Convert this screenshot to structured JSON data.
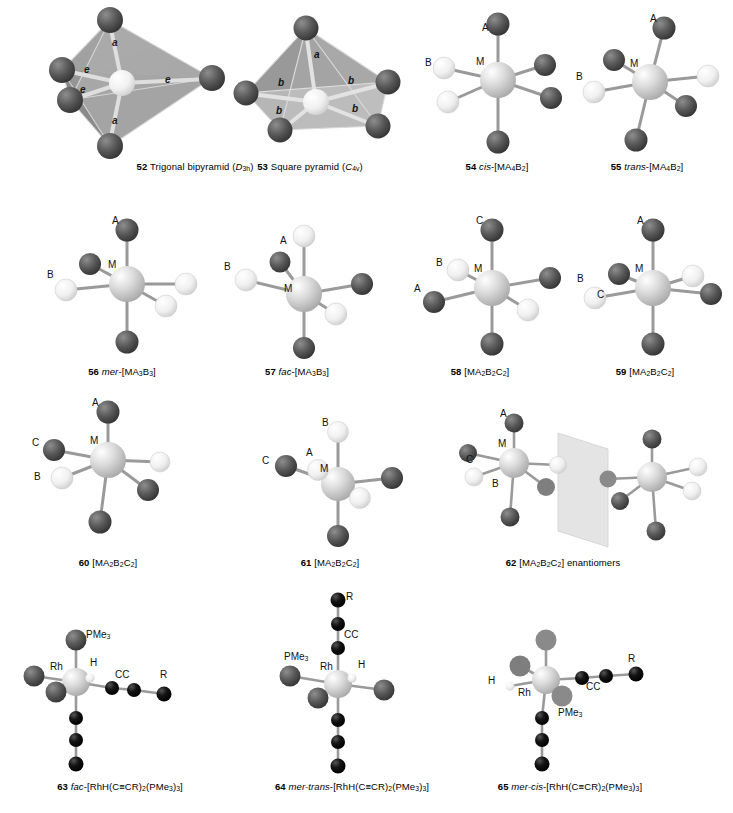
{
  "figure": {
    "panels": [
      {
        "id": "p52",
        "num": "52",
        "name_plain": "Trigonal bipyramid (",
        "name_italic": "D",
        "name_sub": "3h",
        "name_tail": ")",
        "caption_x": 195,
        "caption_y": 162,
        "vertex_labels": [
          "a",
          "e",
          "e",
          "e",
          "a"
        ]
      },
      {
        "id": "p53",
        "num": "53",
        "name_plain": "Square pyramid (",
        "name_italic": "C",
        "name_sub": "4v",
        "name_tail": ")",
        "caption_x": 310,
        "caption_y": 162,
        "vertex_labels": [
          "a",
          "b",
          "b",
          "b",
          "b"
        ]
      },
      {
        "id": "p54",
        "num": "54",
        "italic": "cis",
        "formula_parts": [
          "-[MA",
          "4",
          "B",
          "2",
          "]"
        ],
        "caption_x": 497,
        "caption_y": 162,
        "atom_labels": [
          "A",
          "M",
          "B"
        ]
      },
      {
        "id": "p55",
        "num": "55",
        "italic": "trans",
        "formula_parts": [
          "-[MA",
          "4",
          "B",
          "2",
          "]"
        ],
        "caption_x": 647,
        "caption_y": 162,
        "atom_labels": [
          "A",
          "M",
          "B"
        ]
      },
      {
        "id": "p56",
        "num": "56",
        "italic": "mer",
        "formula_parts": [
          "-[MA",
          "3",
          "B",
          "3",
          "]"
        ],
        "caption_x": 122,
        "caption_y": 367,
        "atom_labels": [
          "A",
          "M",
          "B"
        ]
      },
      {
        "id": "p57",
        "num": "57",
        "italic": "fac",
        "formula_parts": [
          "-[MA",
          "3",
          "B",
          "3",
          "]"
        ],
        "caption_x": 297,
        "caption_y": 367,
        "atom_labels": [
          "A",
          "B",
          "M"
        ]
      },
      {
        "id": "p58",
        "num": "58",
        "italic": "",
        "formula_parts": [
          " [MA",
          "2",
          "B",
          "2",
          "C",
          "2",
          "]"
        ],
        "caption_x": 480,
        "caption_y": 367,
        "atom_labels": [
          "C",
          "M",
          "B",
          "A"
        ]
      },
      {
        "id": "p59",
        "num": "59",
        "italic": "",
        "formula_parts": [
          " [MA",
          "2",
          "B",
          "2",
          "C",
          "2",
          "]"
        ],
        "caption_x": 645,
        "caption_y": 367,
        "atom_labels": [
          "A",
          "M",
          "B",
          "C"
        ]
      },
      {
        "id": "p60",
        "num": "60",
        "italic": "",
        "formula_parts": [
          " [MA",
          "2",
          "B",
          "2",
          "C",
          "2",
          "]"
        ],
        "caption_x": 108,
        "caption_y": 558,
        "atom_labels": [
          "A",
          "M",
          "C",
          "B"
        ]
      },
      {
        "id": "p61",
        "num": "61",
        "italic": "",
        "formula_parts": [
          " [MA",
          "2",
          "B",
          "2",
          "C",
          "2",
          "]"
        ],
        "caption_x": 330,
        "caption_y": 558,
        "atom_labels": [
          "B",
          "A",
          "M",
          "C"
        ]
      },
      {
        "id": "p62",
        "num": "62",
        "italic": "",
        "formula_parts": [
          " [MA",
          "2",
          "B",
          "2",
          "C",
          "2",
          "]"
        ],
        "suffix": " enantiomers",
        "caption_x": 563,
        "caption_y": 558,
        "atom_labels": [
          "A",
          "M",
          "C",
          "B"
        ]
      },
      {
        "id": "p63",
        "num": "63",
        "italic": "fac",
        "formula_text": "-[RhH(C≡CR)",
        "sub1": "2",
        "formula_mid": "(PMe",
        "sub2": "3",
        "formula_close": ")",
        "sub3": "3",
        "formula_end": "]",
        "caption_x": 120,
        "caption_y": 782,
        "atom_labels": [
          "PMe3",
          "Rh",
          "H",
          "CC",
          "R"
        ]
      },
      {
        "id": "p64",
        "num": "64",
        "italic": "mer-trans",
        "formula_text": "-[RhH(C≡CR)",
        "sub1": "2",
        "formula_mid": "(PMe",
        "sub2": "3",
        "formula_close": ")",
        "sub3": "3",
        "formula_end": "]",
        "caption_x": 352,
        "caption_y": 782,
        "atom_labels": [
          "R",
          "CC",
          "PMe3",
          "Rh",
          "H"
        ]
      },
      {
        "id": "p65",
        "num": "65",
        "italic": "mer-cis",
        "formula_text": "-[RhH(C≡CR)",
        "sub1": "2",
        "formula_mid": "(PMe",
        "sub2": "3",
        "formula_close": ")",
        "sub3": "3",
        "formula_end": "]",
        "caption_x": 570,
        "caption_y": 782,
        "atom_labels": [
          "H",
          "Rh",
          "PMe3",
          "CC",
          "R"
        ]
      }
    ],
    "colors": {
      "dark_atom": "#4a4a4a",
      "light_atom": "#f2f2f2",
      "metal_atom": "#c8c8c8",
      "black_atom": "#0d0d0d",
      "bond": "#9a9a9a",
      "face_light": "#c9c9c9",
      "face_dark": "#8f8f8f",
      "mirror_plane": "#dcdcdc"
    },
    "labels": {
      "a": "a",
      "b": "b",
      "e": "e",
      "A": "A",
      "B": "B",
      "C": "C",
      "M": "M",
      "H": "H",
      "R": "R",
      "CC": "CC",
      "Rh": "Rh",
      "PMe": "PMe",
      "PMe_sub": "3"
    }
  }
}
